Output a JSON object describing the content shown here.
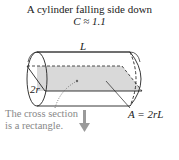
{
  "diagram": {
    "title": "A cylinder falling side down",
    "coefficient": "C ≈ 1.1",
    "length_label": "L",
    "diameter_label": "2r",
    "area_label": "A = 2rL",
    "caption_line1": "The cross section",
    "caption_line2": "is a rectangle.",
    "colors": {
      "cross_section": "#d9d9d9",
      "arrow": "#9a9a9a",
      "caption": "#888888"
    }
  }
}
